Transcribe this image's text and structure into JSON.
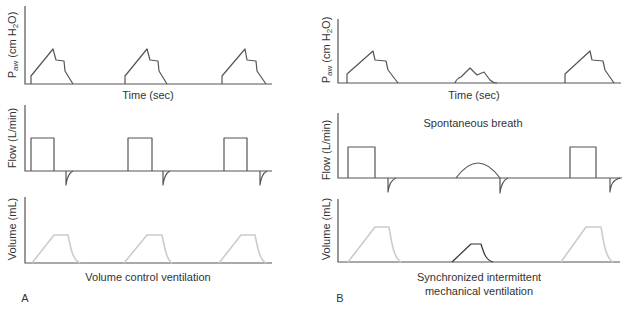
{
  "colors": {
    "axis": "#555555",
    "trace": "#555555",
    "volume_mandatory": "#cccccc",
    "volume_spontaneous": "#333333",
    "text": "#333333"
  },
  "panels": [
    {
      "letter": "A",
      "caption": [
        "Volume control ventilation"
      ],
      "pressure": {
        "y_label": {
          "p": "P",
          "sub": "aw",
          "mid": " (cm H",
          "sub2": "2",
          "end": "O)"
        },
        "x_label": "Time (sec)",
        "axis": "M25,6 L25,84 L272,84",
        "breaths": [
          "M31,84 L31,76 L53,49 L56,60 L64,61 L65,71 L73,84",
          "M125,84 L125,76 L147,49 L150,60 L158,61 L159,71 L167,84",
          "M222,84 L222,76 L245,49 L247,60 L256,61 L257,71 L266,84"
        ]
      },
      "flow": {
        "y_label": "Flow (L/min)",
        "axis": "M25,105 L25,171 L272,171",
        "inspiration": [
          "M31,171 L31,138 L54,138 L54,171",
          "M128,171 L128,138 L152,138 L152,171",
          "M224,171 L224,138 L247,138 L247,171"
        ],
        "expiration": [
          "M66,171 L66,185 C67,177 69,173 73,171",
          "M163,171 L163,185 C164,177 166,173 170,171",
          "M260,171 L260,185 C261,177 263,173 267,171"
        ]
      },
      "volume": {
        "y_label": "Volume (mL)",
        "axis": "M25,197 L25,263 L272,263",
        "mandatory": [
          "M32,263 L54,235 L68,235 C71,250 73,260 80,263",
          "M124,263 L147,235 L162,235 C165,250 167,260 172,263",
          "M219,263 L241,235 L255,235 C258,250 260,260 266,263"
        ]
      }
    },
    {
      "letter": "B",
      "caption": [
        "Synchronized intermittent",
        "mechanical ventilation"
      ],
      "annotation": "Spontaneous breath",
      "pressure": {
        "y_label": {
          "p": "P",
          "sub": "aw",
          "mid": " (cm H",
          "sub2": "2",
          "end": "O)"
        },
        "x_label": "Time (sec)",
        "axis": "M338,19 L338,83 L621,83",
        "breaths": [
          "M347,83 L347,74 L373,51 L375,60 L386,61 L388,70 L398,83",
          "M455,83 C456,80 458,78 461,77 L470,68 L477,75 L484,72 L490,80 C492,82 494,83 497,83",
          "M565,83 L565,74 L590,51 L592,60 L603,61 L605,70 L614,83"
        ]
      },
      "flow": {
        "y_label": "Flow (L/min)",
        "axis": "M338,113 L338,178 L622,178",
        "inspiration": [
          "M348,178 L348,147 L375,147 L375,178",
          "M456,178 Q478,148 500,178",
          "M570,178 L570,147 L596,147 L596,178"
        ],
        "expiration": [
          "M388,178 L388,192 C389,184 391,180 396,178",
          "M500,178 L500,193 C501,185 503,180 508,178",
          "M610,178 L610,192 C611,184 613,180 620,178"
        ]
      },
      "volume": {
        "y_label": "Volume (mL)",
        "axis": "M338,199 L338,262 L620,262",
        "mandatory": [
          "M348,262 L375,227 L389,227 C392,245 394,258 401,262",
          "M561,262 L586,227 L601,227 C604,245 606,258 613,262"
        ],
        "spontaneous": "M452,262 L471,244 L481,244 C484,254 486,260 493,262"
      }
    }
  ]
}
